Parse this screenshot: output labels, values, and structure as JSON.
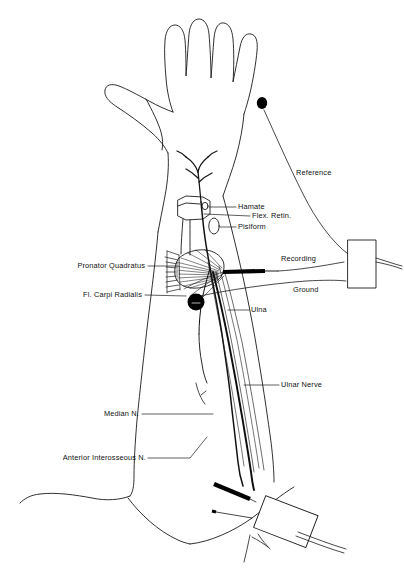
{
  "figure": {
    "type": "anatomical-diagram",
    "background_color": "#ffffff",
    "line_color": "#1a1a1a",
    "fill_color": "#000000"
  },
  "labels": {
    "hamate": "Hamate",
    "flex_retin": "Flex. Retin.",
    "pisiform": "Pisiform",
    "pronator_quadratus": "Pronator Quadratus",
    "fl_carpi_radialis": "Fl. Carpi Radialis",
    "ulna": "Ulna",
    "ulnar_nerve": "Ulnar Nerve",
    "median_n": "Median N.",
    "anterior_interosseous_n": "Anterior Interosseous N.",
    "reference": "Reference",
    "recording": "Recording",
    "ground": "Ground"
  },
  "components": {
    "hand_outline": "hand-outline",
    "forearm_outline": "forearm-outline",
    "reference_electrode_dot": "reference-electrode-dot",
    "recording_needle_electrode": "recording-needle-electrode",
    "flexor_carpi_radialis_cross_section": "flexor-carpi-radialis-cross-section",
    "amplifier_box": "amplifier-box",
    "stimulator_box": "stimulator-box",
    "stimulator_cathode_prong": "stimulator-cathode-prong",
    "stimulator_anode_prong": "stimulator-anode-prong",
    "pronator_quadratus_muscle": "pronator-quadratus-muscle",
    "carpal_bones": "carpal-bones"
  }
}
